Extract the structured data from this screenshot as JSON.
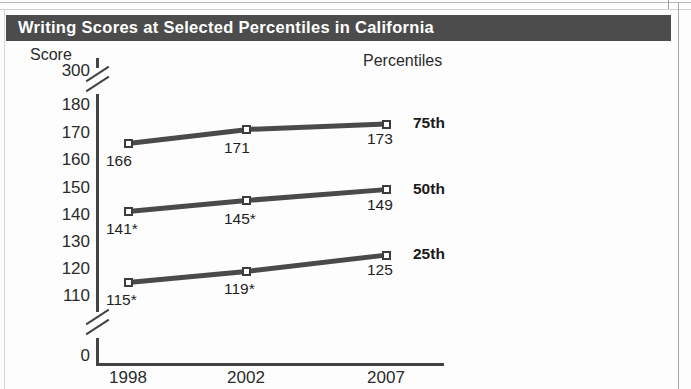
{
  "title": "Writing Scores at Selected Percentiles in California",
  "legend_heading": "Percentiles",
  "y_axis_title": "Score",
  "chart_data": {
    "type": "line",
    "title": "Writing Scores at Selected Percentiles in California",
    "subtitle": "",
    "xlabel": "",
    "ylabel": "Score",
    "categories": [
      "1998",
      "2002",
      "2007"
    ],
    "x_tick_labels": [
      "1998",
      "2002",
      "2007"
    ],
    "y_tick_labels": [
      "300",
      "180",
      "170",
      "160",
      "150",
      "140",
      "130",
      "120",
      "110",
      "0"
    ],
    "ylim": [
      0,
      300
    ],
    "axis_breaks": [
      "between 300 and 180",
      "between 110 and 0"
    ],
    "grid": false,
    "legend_position": "right",
    "legend_heading": "Percentiles",
    "marker": "open-square",
    "series": [
      {
        "name": "75th",
        "values": [
          166,
          171,
          173
        ],
        "labels": [
          "166",
          "171",
          "173"
        ]
      },
      {
        "name": "50th",
        "values": [
          141,
          145,
          149
        ],
        "labels": [
          "141*",
          "145*",
          "149"
        ]
      },
      {
        "name": "25th",
        "values": [
          115,
          119,
          125
        ],
        "labels": [
          "115*",
          "119*",
          "125"
        ]
      }
    ],
    "annotations": [
      "* denotes significantly different from 2007"
    ]
  }
}
